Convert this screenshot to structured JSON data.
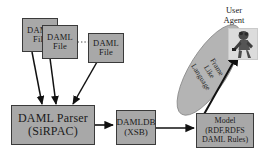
{
  "diagram": {
    "colors": {
      "node_fill": "#a8a8a8",
      "node_stroke": "#3a3a3a",
      "ellipse_fill": "#b4b4b4",
      "arrow": "#111111",
      "background": "#ffffff"
    },
    "files": [
      {
        "line1": "DAML",
        "line2": "File"
      },
      {
        "line1": "DAML",
        "line2": "File"
      },
      {
        "line1": "DAML",
        "line2": "File"
      }
    ],
    "parser": {
      "line1": "DAML Parser",
      "line2": "(SiRPAC)"
    },
    "database": {
      "line1": "DAMLDB",
      "line2": "(XSB)"
    },
    "model": {
      "line1": "Model",
      "line2": "(RDF,RDFS",
      "line3": "DAML Rules)"
    },
    "ellipse": {
      "line1": "Frame",
      "line2": "Like",
      "line3": "Language"
    },
    "user_agent": {
      "line1": "User",
      "line2": "Agent"
    }
  }
}
